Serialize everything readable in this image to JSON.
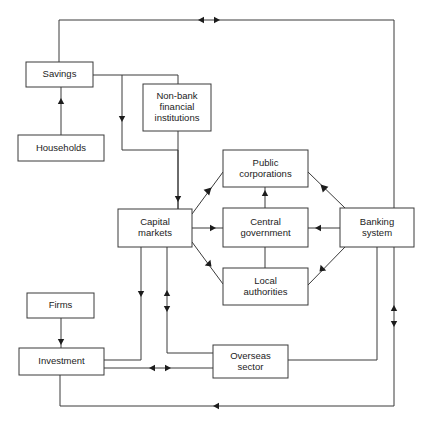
{
  "diagram": {
    "type": "flow-diagram",
    "canvas": {
      "width": 426,
      "height": 424,
      "background": "#ffffff"
    },
    "stroke_color": "#3a3a3a",
    "text_color": "#1c1c1c",
    "nodes": [
      {
        "id": "savings",
        "label": "Savings",
        "x": 26,
        "y": 62,
        "w": 67,
        "h": 25
      },
      {
        "id": "households",
        "label": "Households",
        "x": 18,
        "y": 135,
        "w": 86,
        "h": 26
      },
      {
        "id": "nonbank",
        "label": "Non-bank financial institutions",
        "lines": [
          "Non-bank",
          "financial",
          "institutions"
        ],
        "x": 143,
        "y": 84,
        "w": 68,
        "h": 47
      },
      {
        "id": "capital_markets",
        "label": "Capital markets",
        "lines": [
          "Capital",
          "markets"
        ],
        "x": 118,
        "y": 209,
        "w": 74,
        "h": 38
      },
      {
        "id": "public_corps",
        "label": "Public corporations",
        "lines": [
          "Public",
          "corporations"
        ],
        "x": 223,
        "y": 150,
        "w": 85,
        "h": 37
      },
      {
        "id": "central_gov",
        "label": "Central government",
        "lines": [
          "Central",
          "government"
        ],
        "x": 223,
        "y": 208,
        "w": 85,
        "h": 39
      },
      {
        "id": "local_authorities",
        "label": "Local authorities",
        "lines": [
          "Local",
          "authorities"
        ],
        "x": 223,
        "y": 268,
        "w": 85,
        "h": 37
      },
      {
        "id": "banking_system",
        "label": "Banking system",
        "lines": [
          "Banking",
          "system"
        ],
        "x": 340,
        "y": 208,
        "w": 74,
        "h": 39
      },
      {
        "id": "firms",
        "label": "Firms",
        "x": 27,
        "y": 293,
        "w": 67,
        "h": 25
      },
      {
        "id": "investment",
        "label": "Investment",
        "x": 19,
        "y": 348,
        "w": 85,
        "h": 27
      },
      {
        "id": "overseas",
        "label": "Overseas sector",
        "lines": [
          "Overseas",
          "sector"
        ],
        "x": 213,
        "y": 345,
        "w": 75,
        "h": 33
      }
    ],
    "edges": [
      {
        "id": "households-to-savings",
        "from": "households",
        "to": "savings",
        "points": "61,135 61,87",
        "arrows": [
          {
            "x": 61,
            "y": 104,
            "dir": "up"
          }
        ]
      },
      {
        "id": "savings-to-top-loop",
        "from": "savings",
        "to": "banking-system-right-loop",
        "points": "59,62 59,20 394,20 394,208",
        "arrows": [
          {
            "x": 204,
            "y": 20,
            "dir": "left"
          },
          {
            "x": 214,
            "y": 20,
            "dir": "right"
          }
        ]
      },
      {
        "id": "savings-to-nonbank",
        "from": "savings",
        "to": "nonbank",
        "points": "93,75 178,75 178,84",
        "arrows": []
      },
      {
        "id": "savings-to-capital-markets",
        "from": "savings",
        "to": "capital_markets",
        "points": "122,75 122,150 178,150 178,209",
        "arrows": [
          {
            "x": 122,
            "y": 116,
            "dir": "down"
          },
          {
            "x": 178,
            "y": 196,
            "dir": "down"
          }
        ]
      },
      {
        "id": "nonbank-to-capital-markets",
        "from": "nonbank",
        "to": "capital_markets",
        "points": "178,131 178,209",
        "arrows": []
      },
      {
        "id": "capital-to-public-corps",
        "from": "capital_markets",
        "to": "public_corps",
        "points": "192,214 223,172",
        "arrows": [
          {
            "x": 207,
            "y": 192,
            "dir": "up-right"
          }
        ]
      },
      {
        "id": "capital-to-central-gov",
        "from": "capital_markets",
        "to": "central_gov",
        "points": "192,228 223,228",
        "arrows": [
          {
            "x": 210,
            "y": 228,
            "dir": "right"
          }
        ]
      },
      {
        "id": "capital-to-local-authorities",
        "from": "capital_markets",
        "to": "local_authorities",
        "points": "192,242 223,284",
        "arrows": [
          {
            "x": 207,
            "y": 262,
            "dir": "down-right"
          }
        ]
      },
      {
        "id": "central-gov-to-public-corps",
        "from": "central_gov",
        "to": "public_corps",
        "points": "265,208 265,187",
        "arrows": [
          {
            "x": 265,
            "y": 196,
            "dir": "up"
          }
        ]
      },
      {
        "id": "central-gov-to-local-auth",
        "from": "central_gov",
        "to": "local_authorities",
        "points": "265,247 265,268",
        "arrows": []
      },
      {
        "id": "public-corps-to-banking",
        "from": "public_corps",
        "to": "banking_system",
        "points": "308,172 345,208",
        "arrows": [
          {
            "x": 325,
            "y": 189,
            "dir": "up-left"
          }
        ]
      },
      {
        "id": "banking-to-central-gov",
        "from": "banking_system",
        "to": "central_gov",
        "points": "340,228 308,228",
        "arrows": [
          {
            "x": 321,
            "y": 228,
            "dir": "left"
          }
        ]
      },
      {
        "id": "banking-to-local-auth",
        "from": "banking_system",
        "to": "local_authorities",
        "points": "345,247 308,285",
        "arrows": [
          {
            "x": 324,
            "y": 267,
            "dir": "down-left"
          }
        ]
      },
      {
        "id": "banking-to-overseas",
        "from": "banking_system",
        "to": "overseas",
        "points": "377,247 377,360 288,360",
        "arrows": []
      },
      {
        "id": "banking-right-to-bottom",
        "from": "banking_system",
        "to": "investment",
        "points": "394,247 394,406 60,406 60,375",
        "arrows": [
          {
            "x": 394,
            "y": 311,
            "dir": "up"
          },
          {
            "x": 394,
            "y": 321,
            "dir": "down"
          },
          {
            "x": 219,
            "y": 406,
            "dir": "left"
          }
        ]
      },
      {
        "id": "capital-to-investment",
        "from": "capital_markets",
        "to": "investment",
        "points": "141,247 141,360 104,360",
        "arrows": [
          {
            "x": 141,
            "y": 291,
            "dir": "down"
          }
        ]
      },
      {
        "id": "capital-to-overseas",
        "from": "capital_markets",
        "to": "overseas",
        "points": "167,247 167,353 213,353",
        "arrows": [
          {
            "x": 167,
            "y": 296,
            "dir": "up"
          },
          {
            "x": 167,
            "y": 306,
            "dir": "down"
          }
        ]
      },
      {
        "id": "investment-to-overseas",
        "from": "investment",
        "to": "overseas",
        "points": "104,368 213,368",
        "arrows": [
          {
            "x": 155,
            "y": 368,
            "dir": "left"
          },
          {
            "x": 165,
            "y": 368,
            "dir": "right"
          }
        ]
      },
      {
        "id": "firms-to-investment",
        "from": "firms",
        "to": "investment",
        "points": "61,318 61,348",
        "arrows": [
          {
            "x": 61,
            "y": 339,
            "dir": "down"
          }
        ]
      }
    ]
  }
}
